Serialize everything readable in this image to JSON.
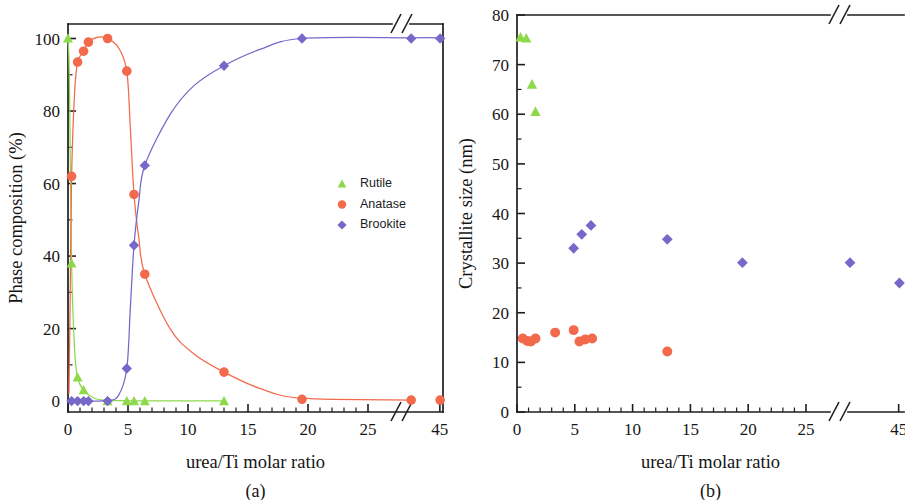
{
  "figure": {
    "background": "#ffffff",
    "panels": [
      {
        "id": "a",
        "caption": "(a)"
      },
      {
        "id": "b",
        "caption": "(b)"
      }
    ]
  },
  "series_colors": {
    "rutile": "#8ED94B",
    "anatase": "#F2694C",
    "brookite": "#7668C8",
    "axis": "#1e1e1e"
  },
  "legend": {
    "visible_in": "a",
    "items": [
      {
        "label": "Rutile",
        "marker": "triangle",
        "color": "#8ED94B"
      },
      {
        "label": "Anatase",
        "marker": "circle",
        "color": "#F2694C"
      },
      {
        "label": "Brookite",
        "marker": "diamond",
        "color": "#7668C8"
      }
    ]
  },
  "chart_data": [
    {
      "panel": "a",
      "caption": "(a)",
      "type": "scatter",
      "title": "",
      "xlabel": "urea/Ti molar ratio",
      "ylabel": "Phase composition (%)",
      "xlim": [
        0,
        46
      ],
      "ylim": [
        -3,
        104
      ],
      "x_ticks": [
        0,
        5,
        10,
        15,
        20,
        25,
        45
      ],
      "x_tick_labels": [
        "0",
        "5",
        "10",
        "15",
        "20",
        "25",
        "45"
      ],
      "y_ticks": [
        0,
        20,
        40,
        60,
        80,
        100
      ],
      "y_tick_labels": [
        "0",
        "20",
        "40",
        "60",
        "80",
        "100"
      ],
      "axis_break": {
        "axis": "x",
        "between": [
          25,
          45
        ],
        "symbol": "//"
      },
      "grid": false,
      "legend_position": "inside-right-middle",
      "series": [
        {
          "name": "Rutile",
          "marker": "triangle",
          "color": "#8ED94B",
          "has_fit_line": true,
          "points": [
            {
              "x": 0.0,
              "y": 100.0
            },
            {
              "x": 0.3,
              "y": 38.0
            },
            {
              "x": 0.8,
              "y": 6.5
            },
            {
              "x": 1.3,
              "y": 3.0
            },
            {
              "x": 3.3,
              "y": 0.0
            },
            {
              "x": 4.9,
              "y": 0.0
            },
            {
              "x": 5.5,
              "y": 0.0
            },
            {
              "x": 6.4,
              "y": 0.0
            },
            {
              "x": 13.0,
              "y": 0.0
            }
          ]
        },
        {
          "name": "Anatase",
          "marker": "circle",
          "color": "#F2694C",
          "has_fit_line": true,
          "points": [
            {
              "x": 0.3,
              "y": 62.0
            },
            {
              "x": 0.8,
              "y": 93.5
            },
            {
              "x": 1.3,
              "y": 96.5
            },
            {
              "x": 1.7,
              "y": 99.0
            },
            {
              "x": 3.3,
              "y": 100.0
            },
            {
              "x": 4.9,
              "y": 91.0
            },
            {
              "x": 5.5,
              "y": 57.0
            },
            {
              "x": 6.4,
              "y": 35.0
            },
            {
              "x": 13.0,
              "y": 8.0
            },
            {
              "x": 19.5,
              "y": 0.5
            },
            {
              "x": 25.8,
              "y": 0.3
            },
            {
              "x": 45.2,
              "y": 0.3
            }
          ]
        },
        {
          "name": "Brookite",
          "marker": "diamond",
          "color": "#7668C8",
          "has_fit_line": true,
          "points": [
            {
              "x": 0.3,
              "y": 0.0
            },
            {
              "x": 0.8,
              "y": 0.0
            },
            {
              "x": 1.3,
              "y": 0.0
            },
            {
              "x": 1.7,
              "y": 0.0
            },
            {
              "x": 3.3,
              "y": 0.0
            },
            {
              "x": 4.9,
              "y": 9.0
            },
            {
              "x": 5.5,
              "y": 43.0
            },
            {
              "x": 6.4,
              "y": 65.0
            },
            {
              "x": 13.0,
              "y": 92.5
            },
            {
              "x": 19.5,
              "y": 100.0
            },
            {
              "x": 25.8,
              "y": 100.0
            },
            {
              "x": 45.2,
              "y": 100.0
            }
          ]
        }
      ]
    },
    {
      "panel": "b",
      "caption": "(b)",
      "type": "scatter",
      "title": "",
      "xlabel": "urea/Ti molar ratio",
      "ylabel": "Crystallite size (nm)",
      "xlim": [
        0,
        46
      ],
      "ylim": [
        0,
        80
      ],
      "x_ticks": [
        0,
        5,
        10,
        15,
        20,
        25,
        45
      ],
      "x_tick_labels": [
        "0",
        "5",
        "10",
        "15",
        "20",
        "25",
        "45"
      ],
      "y_ticks": [
        0,
        10,
        20,
        30,
        40,
        50,
        60,
        70,
        80
      ],
      "y_tick_labels": [
        "0",
        "10",
        "20",
        "30",
        "40",
        "50",
        "60",
        "70",
        "80"
      ],
      "axis_break": {
        "axis": "x",
        "between": [
          25,
          45
        ],
        "symbol": "//"
      },
      "grid": false,
      "legend_position": "none",
      "series": [
        {
          "name": "Rutile",
          "marker": "triangle",
          "color": "#8ED94B",
          "has_fit_line": false,
          "points": [
            {
              "x": 0.3,
              "y": 75.5
            },
            {
              "x": 0.8,
              "y": 75.3
            },
            {
              "x": 1.3,
              "y": 66.0
            },
            {
              "x": 1.6,
              "y": 60.5
            }
          ]
        },
        {
          "name": "Anatase",
          "marker": "circle",
          "color": "#F2694C",
          "has_fit_line": false,
          "points": [
            {
              "x": 0.5,
              "y": 14.8
            },
            {
              "x": 0.9,
              "y": 14.3
            },
            {
              "x": 1.2,
              "y": 14.2
            },
            {
              "x": 1.6,
              "y": 14.8
            },
            {
              "x": 3.3,
              "y": 16.0
            },
            {
              "x": 4.9,
              "y": 16.5
            },
            {
              "x": 5.4,
              "y": 14.2
            },
            {
              "x": 5.9,
              "y": 14.6
            },
            {
              "x": 6.5,
              "y": 14.8
            },
            {
              "x": 13.0,
              "y": 12.2
            }
          ]
        },
        {
          "name": "Brookite",
          "marker": "diamond",
          "color": "#7668C8",
          "has_fit_line": false,
          "points": [
            {
              "x": 4.9,
              "y": 33.0
            },
            {
              "x": 5.6,
              "y": 35.8
            },
            {
              "x": 6.4,
              "y": 37.6
            },
            {
              "x": 13.0,
              "y": 34.8
            },
            {
              "x": 19.5,
              "y": 30.1
            },
            {
              "x": 25.8,
              "y": 30.1
            },
            {
              "x": 45.3,
              "y": 26.0
            }
          ]
        }
      ]
    }
  ]
}
